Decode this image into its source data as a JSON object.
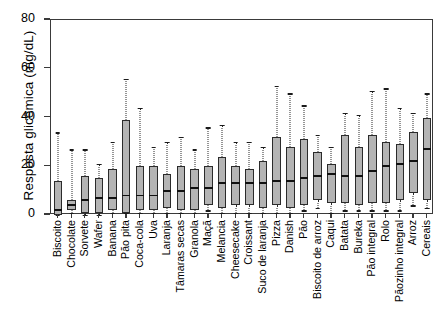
{
  "chart_data": {
    "type": "box",
    "title": "",
    "xlabel": "",
    "ylabel": "Resposta glicêmica (mg/dL)",
    "ylim": [
      0,
      80
    ],
    "yticks": [
      0,
      20,
      40,
      60,
      80
    ],
    "grid": false,
    "legend": null,
    "categories": [
      "Biscoito",
      "Chocolate",
      "Sorvete",
      "Wafer",
      "Banana",
      "Pão pita",
      "Coca-cola",
      "Uva",
      "Laranja",
      "Tâmaras secas",
      "Granola",
      "Maçã",
      "Melancia",
      "Cheesecake",
      "Croissant",
      "Suco de laranja",
      "Pizza",
      "Danish",
      "Pão",
      "Biscoito de arroz",
      "Caqui",
      "Batata",
      "Bureka",
      "Pão integral",
      "Rolo",
      "Pãozinho integral",
      "Arroz",
      "Cereais"
    ],
    "boxes": [
      {
        "label": "Biscoito",
        "whisker_low": 0,
        "q1": 0,
        "median": 2,
        "q3": 14,
        "whisker_high": 34
      },
      {
        "label": "Chocolate",
        "whisker_low": 1,
        "q1": 2,
        "median": 4,
        "q3": 6,
        "whisker_high": 27
      },
      {
        "label": "Sorvete",
        "whisker_low": 0,
        "q1": 1,
        "median": 6,
        "q3": 16,
        "whisker_high": 27
      },
      {
        "label": "Wafer",
        "whisker_low": 0,
        "q1": 1,
        "median": 7,
        "q3": 15,
        "whisker_high": 21
      },
      {
        "label": "Banana",
        "whisker_low": 1,
        "q1": 2,
        "median": 7,
        "q3": 19,
        "whisker_high": 30
      },
      {
        "label": "Pão pita",
        "whisker_low": 1,
        "q1": 1,
        "median": 8,
        "q3": 39,
        "whisker_high": 56
      },
      {
        "label": "Coca-cola",
        "whisker_low": 1,
        "q1": 2,
        "median": 8,
        "q3": 20,
        "whisker_high": 44
      },
      {
        "label": "Uva",
        "whisker_low": 1,
        "q1": 2,
        "median": 8,
        "q3": 20,
        "whisker_high": 28
      },
      {
        "label": "Laranja",
        "whisker_low": 1,
        "q1": 3,
        "median": 10,
        "q3": 17,
        "whisker_high": 30
      },
      {
        "label": "Tâmaras secas",
        "whisker_low": 1,
        "q1": 2,
        "median": 10,
        "q3": 20,
        "whisker_high": 32
      },
      {
        "label": "Granola",
        "whisker_low": 1,
        "q1": 2,
        "median": 11,
        "q3": 19,
        "whisker_high": 27
      },
      {
        "label": "Maçã",
        "whisker_low": 2,
        "q1": 4,
        "median": 11,
        "q3": 20,
        "whisker_high": 36
      },
      {
        "label": "Melancia",
        "whisker_low": 1,
        "q1": 3,
        "median": 13,
        "q3": 24,
        "whisker_high": 37
      },
      {
        "label": "Cheesecake",
        "whisker_low": 1,
        "q1": 4,
        "median": 13,
        "q3": 20,
        "whisker_high": 30
      },
      {
        "label": "Croissant",
        "whisker_low": 1,
        "q1": 4,
        "median": 13,
        "q3": 19,
        "whisker_high": 30
      },
      {
        "label": "Suco de laranja",
        "whisker_low": 1,
        "q1": 3,
        "median": 13,
        "q3": 22,
        "whisker_high": 28
      },
      {
        "label": "Pizza",
        "whisker_low": 1,
        "q1": 4,
        "median": 14,
        "q3": 32,
        "whisker_high": 53
      },
      {
        "label": "Danish",
        "whisker_low": 1,
        "q1": 3,
        "median": 14,
        "q3": 28,
        "whisker_high": 50
      },
      {
        "label": "Pão",
        "whisker_low": 2,
        "q1": 4,
        "median": 15,
        "q3": 31,
        "whisker_high": 45
      },
      {
        "label": "Biscoito de arroz",
        "whisker_low": 3,
        "q1": 6,
        "median": 16,
        "q3": 26,
        "whisker_high": 33
      },
      {
        "label": "Caqui",
        "whisker_low": 1,
        "q1": 5,
        "median": 17,
        "q3": 21,
        "whisker_high": 28
      },
      {
        "label": "Batata",
        "whisker_low": 2,
        "q1": 5,
        "median": 16,
        "q3": 33,
        "whisker_high": 42
      },
      {
        "label": "Bureka",
        "whisker_low": 2,
        "q1": 4,
        "median": 16,
        "q3": 28,
        "whisker_high": 41
      },
      {
        "label": "Pão integral",
        "whisker_low": 2,
        "q1": 5,
        "median": 18,
        "q3": 33,
        "whisker_high": 51
      },
      {
        "label": "Rolo",
        "whisker_low": 2,
        "q1": 5,
        "median": 20,
        "q3": 30,
        "whisker_high": 52
      },
      {
        "label": "Pãozinho integral",
        "whisker_low": 2,
        "q1": 6,
        "median": 21,
        "q3": 29,
        "whisker_high": 44
      },
      {
        "label": "Arroz",
        "whisker_low": 4,
        "q1": 9,
        "median": 22,
        "q3": 34,
        "whisker_high": 42
      },
      {
        "label": "Cereais",
        "whisker_low": 3,
        "q1": 6,
        "median": 27,
        "q3": 40,
        "whisker_high": 50
      }
    ],
    "colors": {
      "box_fill": "#b4b4b4",
      "box_edge": "#2b2b2b",
      "median": "#111111",
      "whisker": "#2b2b2b",
      "frame": "#3a3a3a",
      "background": "#ffffff"
    }
  }
}
